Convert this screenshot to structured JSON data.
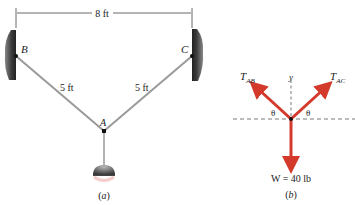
{
  "figure_a": {
    "dimension_top": "8 ft",
    "label_B": "B",
    "label_C": "C",
    "label_A": "A",
    "cable_AB_length": "5 ft",
    "cable_AC_length": "5 ft",
    "caption": "(a)"
  },
  "figure_b": {
    "force_AB": "T",
    "force_AB_sub": "AB",
    "force_AC": "T",
    "force_AC_sub": "AC",
    "axis_y": "y",
    "angle_left": "θ",
    "angle_right": "θ",
    "weight": "W = 40 lb",
    "caption": "(b)"
  },
  "colors": {
    "arrow": "#d33a2c",
    "cable": "#9a9a9a",
    "wall": "#555555",
    "text": "#222222"
  }
}
